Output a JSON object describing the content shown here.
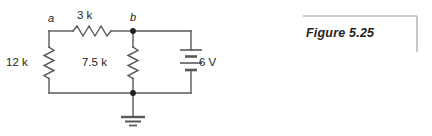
{
  "figure": {
    "caption": "Figure 5.25",
    "bracket": {
      "top_rule": "horizontal-rule",
      "right_rule": "vertical-rule"
    }
  },
  "circuit": {
    "title": "resistor-network-with-voltage-source",
    "line_color": "#58595b",
    "text_color": "#231f20",
    "nodes": [
      {
        "id": "a",
        "label": "a",
        "type": "junction-label",
        "dot": false
      },
      {
        "id": "b",
        "label": "b",
        "type": "junction-label",
        "dot": true
      },
      {
        "id": "gnd",
        "label": "",
        "type": "ground-node",
        "dot": true
      }
    ],
    "components": [
      {
        "name": "resistor-12k",
        "label": "12 k",
        "orientation": "vertical",
        "symbol": "zigzag-resistor"
      },
      {
        "name": "resistor-3k",
        "label": "3 k",
        "orientation": "horizontal",
        "symbol": "zigzag-resistor"
      },
      {
        "name": "resistor-7p5k",
        "label": "7.5 k",
        "orientation": "vertical",
        "symbol": "zigzag-resistor"
      },
      {
        "name": "voltage-source-6v",
        "label": "6 V",
        "orientation": "vertical",
        "symbol": "battery-cell-stack"
      },
      {
        "name": "ground",
        "label": "",
        "orientation": "vertical",
        "symbol": "earth-ground"
      }
    ]
  }
}
